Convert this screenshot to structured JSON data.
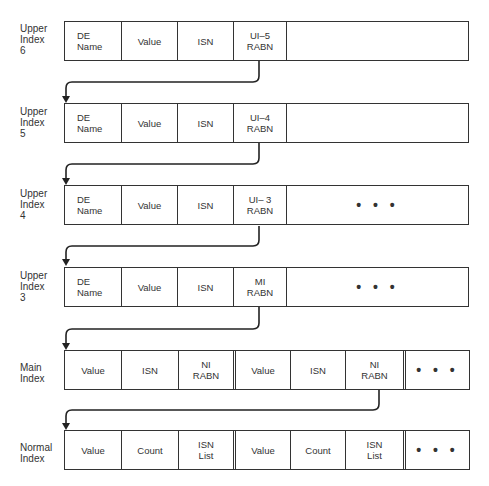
{
  "rows": [
    {
      "label": "Upper\nIndex\n6",
      "cells": [
        "DE\nName",
        "Value",
        "ISN",
        "UI–5\nRABN",
        ""
      ]
    },
    {
      "label": "Upper\nIndex\n5",
      "cells": [
        "DE\nName",
        "Value",
        "ISN",
        "UI–4\nRABN",
        ""
      ]
    },
    {
      "label": "Upper\nIndex\n4",
      "cells": [
        "DE\nName",
        "Value",
        "ISN",
        "UI– 3\nRABN",
        "• • •"
      ]
    },
    {
      "label": "Upper\nIndex\n3",
      "cells": [
        "DE\nName",
        "Value",
        "ISN",
        "MI\nRABN",
        "• • •"
      ]
    },
    {
      "label": "Main\nIndex",
      "cells": [
        "Value",
        "ISN",
        "NI\nRABN",
        "Value",
        "ISN",
        "NI\nRABN",
        "• • •"
      ]
    },
    {
      "label": "Normal\nIndex",
      "cells": [
        "Value",
        "Count",
        "ISN\nList",
        "Value",
        "Count",
        "ISN\nList",
        "• • •"
      ]
    }
  ],
  "colors": {
    "line": "#333333",
    "background": "#ffffff"
  }
}
